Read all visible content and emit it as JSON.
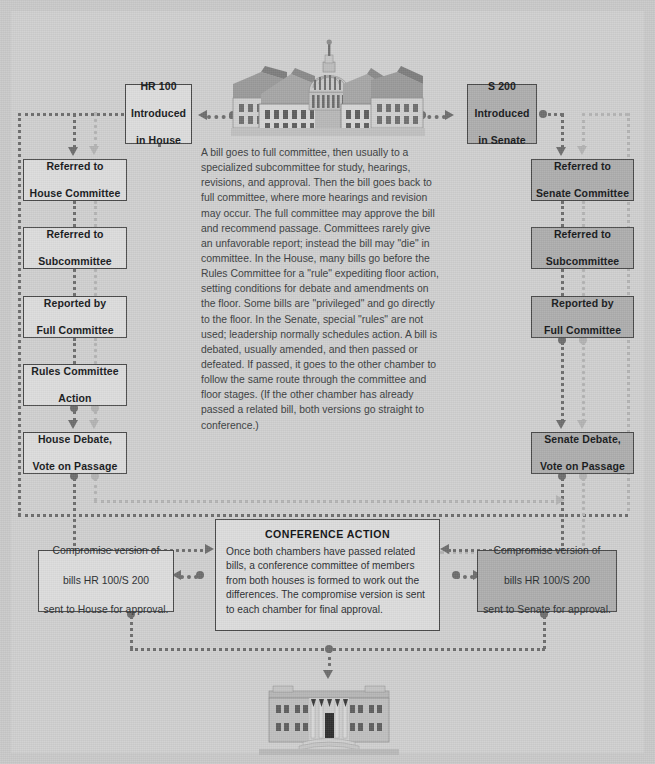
{
  "diagram": {
    "colors": {
      "page_background": "#c9c9c9",
      "panel_background": "#cfcfcf",
      "box_light": "#dcdcdc",
      "box_dark": "#adadad",
      "border": "#4a4a4a",
      "connector_dark": "#6d6d6d",
      "connector_light": "#b3b3b3"
    }
  },
  "house_column": {
    "intro": "HR 100\nIntroduced\nin House",
    "intro_line1": "HR 100",
    "intro_line2": "Introduced",
    "intro_line3": "in House",
    "steps": [
      {
        "line1": "Referred to",
        "line2": "House Committee"
      },
      {
        "line1": "Referred to",
        "line2": "Subcommittee"
      },
      {
        "line1": "Reported by",
        "line2": "Full Committee"
      },
      {
        "line1": "Rules Committee",
        "line2": "Action"
      },
      {
        "line1": "House Debate,",
        "line2": "Vote on Passage"
      }
    ]
  },
  "senate_column": {
    "intro_line1": "S 200",
    "intro_line2": "Introduced",
    "intro_line3": "in Senate",
    "steps": [
      {
        "line1": "Referred to",
        "line2": "Senate Committee"
      },
      {
        "line1": "Referred to",
        "line2": "Subcommittee"
      },
      {
        "line1": "Reported by",
        "line2": "Full Committee"
      },
      {
        "line1": "Senate Debate,",
        "line2": "Vote on Passage"
      }
    ]
  },
  "narrative": {
    "text": "A bill goes to full committee, then usually to a specialized subcommittee for study, hearings, revisions, and approval. Then the bill goes back to full committee, where more hearings and revision may occur. The full committee may approve the bill and recommend passage. Committees rarely give an unfavorable report; instead the bill may \"die\" in committee. In the House, many bills go before the Rules Committee for a \"rule\" expediting floor action, setting conditions for debate and amendments on the floor. Some bills are \"privileged\" and go directly to the floor. In the Senate, special \"rules\" are not used; leadership normally schedules action. A bill is debated, usually amended, and then passed or defeated. If passed, it goes to the other chamber to follow the same route through the committee and floor stages. (If the other chamber has already passed a related bill, both versions go straight to conference.)"
  },
  "conference": {
    "title": "CONFERENCE ACTION",
    "body": "Once both chambers have passed related bills, a conference committee of members from both houses is formed to work out the differences. The compromise version is sent to each chamber for final approval."
  },
  "compromise_house": {
    "line1": "Compromise version of",
    "line2": "bills HR 100/S 200",
    "line3": "sent to House for approval."
  },
  "compromise_senate": {
    "line1": "Compromise version of",
    "line2": "bills HR 100/S 200",
    "line3": "sent to Senate for approval."
  },
  "illustrations": {
    "top": "capitol-building",
    "bottom": "white-house-building"
  }
}
